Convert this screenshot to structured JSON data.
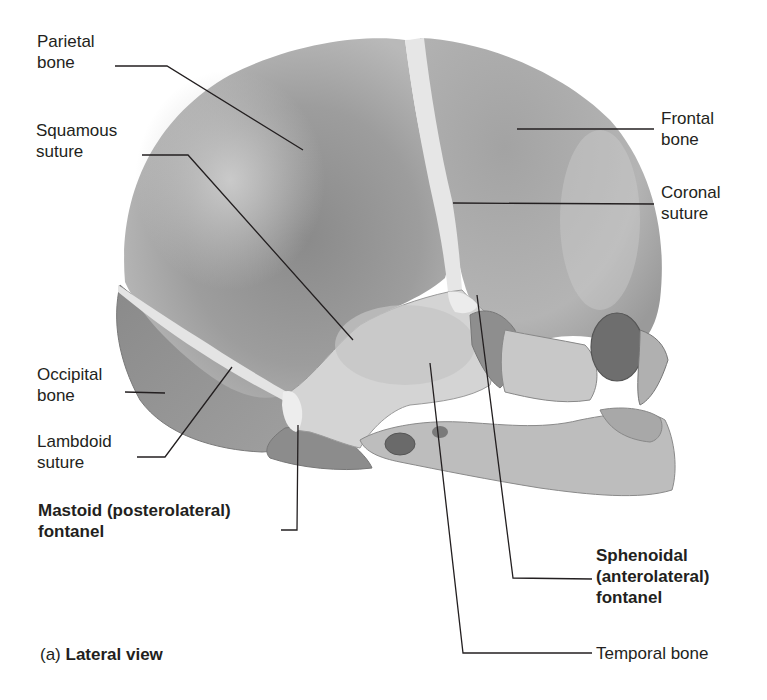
{
  "figure": {
    "caption_prefix": "(a)",
    "caption_title": "Lateral view"
  },
  "labels": {
    "parietal_bone": [
      "Parietal",
      "bone"
    ],
    "squamous_suture": [
      "Squamous",
      "suture"
    ],
    "frontal_bone": [
      "Frontal",
      "bone"
    ],
    "coronal_suture": [
      "Coronal",
      "suture"
    ],
    "occipital_bone": [
      "Occipital",
      "bone"
    ],
    "lambdoid_suture": [
      "Lambdoid",
      "suture"
    ],
    "mastoid_fontanel": [
      "Mastoid (posterolateral)",
      "fontanel"
    ],
    "sphenoidal_fontanel": [
      "Sphenoidal",
      "(anterolateral)",
      "fontanel"
    ],
    "temporal_bone": [
      "Temporal bone"
    ]
  },
  "colors": {
    "text": "#231f20",
    "leader_line": "#231f20",
    "bone_dark": "#8f8f8f",
    "bone_mid": "#ababab",
    "bone_light": "#d2d2d2",
    "membrane": "#e8e8e8"
  }
}
